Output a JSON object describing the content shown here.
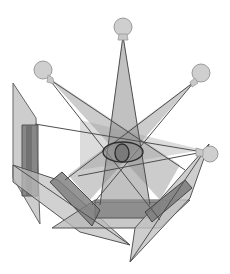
{
  "diagram": {
    "colors": {
      "background": "#ffffff",
      "bulb_fill": "#cfcfcf",
      "bulb_stroke": "#9a9a9a",
      "beam_stroke": "#555555",
      "panel_light": "#bdbdbd",
      "panel_mid": "#8f8f8f",
      "panel_dark": "#6e6e6e",
      "outline": "#4a4a4a"
    },
    "bulbs": [
      {
        "id": "top",
        "cx": 123,
        "cy": 27,
        "r": 9
      },
      {
        "id": "left",
        "cx": 43,
        "cy": 71,
        "r": 9
      },
      {
        "id": "right",
        "cx": 201,
        "cy": 74,
        "r": 9
      },
      {
        "id": "lower-right",
        "cx": 209,
        "cy": 153,
        "r": 8
      }
    ],
    "eye": {
      "cx": 123,
      "cy": 152,
      "rx": 20,
      "ry": 10
    }
  }
}
